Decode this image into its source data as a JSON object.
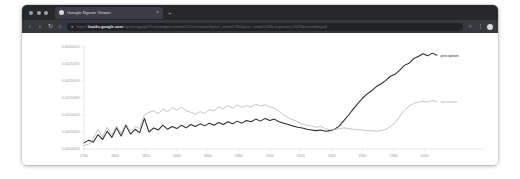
{
  "window": {
    "traffic_lights": [
      "close",
      "minimize",
      "zoom"
    ],
    "tab": {
      "title": "Google Ngram Viewer",
      "favicon": "page-favicon",
      "close_label": "×"
    },
    "new_tab_label": "+",
    "toolbar": {
      "back_label": "‹",
      "forward_label": "›",
      "reload_label": "↻",
      "home_label": "⌂",
      "lock_label": "●",
      "url_prefix": "https://",
      "url_domain": "books.google.com",
      "url_path": "/ngrams/graph?content=perception%2Csensation&year_start=1780&year_end=2019&corpus=en-2019&smoothing=3",
      "extensions_label": "⋮",
      "bookmark_label": "☆",
      "profile_label": "avatar"
    }
  },
  "chart_data": {
    "type": "line",
    "title": "",
    "xlabel": "",
    "ylabel": "",
    "xlim": [
      1780,
      2010
    ],
    "ylim": [
      0,
      0.003
    ],
    "grid": false,
    "legend_position": "right-inline",
    "y_ticks": [
      "0.003000%",
      "0.002500%",
      "0.002000%",
      "0.001500%",
      "0.001000%",
      "0.000500%",
      "0.000000%"
    ],
    "y_tick_values": [
      0.003,
      0.0025,
      0.002,
      0.0015,
      0.001,
      0.0005,
      0.0
    ],
    "x_ticks": [
      "1780",
      "1800",
      "1820",
      "1840",
      "1860",
      "1880",
      "1900",
      "1920",
      "1940",
      "1960",
      "1980",
      "2000"
    ],
    "x_tick_values": [
      1780,
      1800,
      1820,
      1840,
      1860,
      1880,
      1900,
      1920,
      1940,
      1960,
      1980,
      2000
    ],
    "series": [
      {
        "name": "perception",
        "color": "#2b2b2b",
        "x": [
          1780,
          1783,
          1786,
          1789,
          1792,
          1795,
          1798,
          1801,
          1804,
          1807,
          1810,
          1813,
          1816,
          1819,
          1822,
          1825,
          1828,
          1831,
          1834,
          1837,
          1840,
          1843,
          1846,
          1849,
          1852,
          1855,
          1858,
          1861,
          1864,
          1867,
          1870,
          1873,
          1876,
          1879,
          1882,
          1885,
          1888,
          1891,
          1894,
          1897,
          1900,
          1903,
          1906,
          1909,
          1912,
          1915,
          1918,
          1921,
          1924,
          1927,
          1930,
          1933,
          1936,
          1939,
          1942,
          1945,
          1948,
          1951,
          1954,
          1957,
          1960,
          1963,
          1966,
          1969,
          1972,
          1975,
          1978,
          1981,
          1984,
          1987,
          1990,
          1993,
          1996,
          1999,
          2002,
          2005,
          2008
        ],
        "y": [
          0.00018,
          0.00026,
          0.0002,
          0.00042,
          0.00028,
          0.00052,
          0.00034,
          0.00062,
          0.00038,
          0.0007,
          0.00044,
          0.00058,
          0.00048,
          0.0009,
          0.0005,
          0.00062,
          0.00056,
          0.0007,
          0.00058,
          0.00066,
          0.0006,
          0.0007,
          0.00062,
          0.00072,
          0.00066,
          0.00074,
          0.00068,
          0.00076,
          0.0007,
          0.00078,
          0.00072,
          0.0008,
          0.00074,
          0.00082,
          0.00076,
          0.00084,
          0.0008,
          0.00088,
          0.00082,
          0.0009,
          0.00084,
          0.00088,
          0.0008,
          0.00076,
          0.00072,
          0.00068,
          0.00064,
          0.00062,
          0.00058,
          0.00056,
          0.00054,
          0.00056,
          0.00052,
          0.00054,
          0.00058,
          0.00068,
          0.00084,
          0.001,
          0.00118,
          0.00134,
          0.0015,
          0.00162,
          0.00172,
          0.00184,
          0.00192,
          0.00202,
          0.00214,
          0.0022,
          0.00232,
          0.00246,
          0.00252,
          0.00266,
          0.00272,
          0.0028,
          0.00274,
          0.00282,
          0.00276
        ]
      },
      {
        "name": "sensation",
        "color": "#b0b0b0",
        "x": [
          1780,
          1783,
          1786,
          1789,
          1792,
          1795,
          1798,
          1801,
          1804,
          1807,
          1810,
          1813,
          1816,
          1819,
          1822,
          1825,
          1828,
          1831,
          1834,
          1837,
          1840,
          1843,
          1846,
          1849,
          1852,
          1855,
          1858,
          1861,
          1864,
          1867,
          1870,
          1873,
          1876,
          1879,
          1882,
          1885,
          1888,
          1891,
          1894,
          1897,
          1900,
          1903,
          1906,
          1909,
          1912,
          1915,
          1918,
          1921,
          1924,
          1927,
          1930,
          1933,
          1936,
          1939,
          1942,
          1945,
          1948,
          1951,
          1954,
          1957,
          1960,
          1963,
          1966,
          1969,
          1972,
          1975,
          1978,
          1981,
          1984,
          1987,
          1990,
          1993,
          1996,
          1999,
          2002,
          2005,
          2008
        ],
        "y": [
          0.0001,
          0.00014,
          0.0003,
          0.00058,
          0.00036,
          0.00064,
          0.00042,
          0.00068,
          0.00046,
          0.00074,
          0.00052,
          0.00066,
          0.0006,
          0.001,
          0.00108,
          0.00112,
          0.00104,
          0.00118,
          0.0011,
          0.00122,
          0.00114,
          0.00124,
          0.00112,
          0.00108,
          0.00102,
          0.0011,
          0.00104,
          0.00116,
          0.00112,
          0.00124,
          0.00118,
          0.00128,
          0.0012,
          0.0013,
          0.00122,
          0.00128,
          0.00124,
          0.00132,
          0.00126,
          0.0013,
          0.00124,
          0.0012,
          0.00112,
          0.001,
          0.00092,
          0.00086,
          0.0008,
          0.00074,
          0.0007,
          0.00068,
          0.00064,
          0.00066,
          0.0006,
          0.00056,
          0.00058,
          0.0006,
          0.00062,
          0.0006,
          0.00058,
          0.00056,
          0.00056,
          0.00054,
          0.00054,
          0.00052,
          0.00054,
          0.00058,
          0.00066,
          0.00078,
          0.00096,
          0.00114,
          0.00126,
          0.00134,
          0.00138,
          0.0014,
          0.00138,
          0.00142,
          0.0014
        ]
      }
    ]
  }
}
